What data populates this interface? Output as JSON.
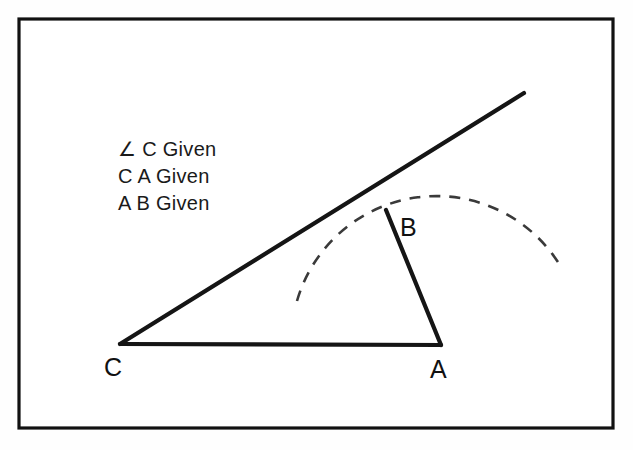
{
  "figure": {
    "background_color": "#fefefe",
    "frame": {
      "name": "outer-border",
      "stroke_color": "#111111",
      "x": 19,
      "y": 19,
      "width": 594,
      "height": 409
    },
    "given_list": {
      "lines": [
        "∠ C Given",
        "C A Given",
        "A B Given"
      ],
      "x": 118,
      "y_start": 156,
      "line_height": 27,
      "font_size": 20,
      "color": "#1a1a1a"
    },
    "points": {
      "C": {
        "label": "C",
        "x": 120,
        "y": 344,
        "label_x": 104,
        "label_y": 376
      },
      "A": {
        "label": "A",
        "x": 441,
        "y": 344,
        "label_x": 430,
        "label_y": 378
      },
      "B": {
        "label": "B",
        "x": 386,
        "y": 210,
        "label_x": 400,
        "label_y": 236
      },
      "ray_end": {
        "label": "",
        "x": 524,
        "y": 93
      }
    },
    "segments": [
      {
        "name": "ray-from-c",
        "from": "C",
        "to": "ray_end",
        "style": "solid",
        "stroke_width": 4.2,
        "color": "#151515"
      },
      {
        "name": "base-c-to-a",
        "from": "C",
        "to": "A",
        "style": "solid",
        "stroke_width": 4.2,
        "color": "#151515"
      },
      {
        "name": "side-a-to-b",
        "from": "A",
        "to": "B",
        "style": "solid",
        "stroke_width": 4.2,
        "color": "#151515"
      }
    ],
    "arc": {
      "name": "compass-arc-from-a",
      "center": "A",
      "radius": 145,
      "style": "dashed",
      "dash_pattern": "11 9",
      "color": "#3a3a3a",
      "stroke_width": 2.6,
      "start_x": 297,
      "start_y": 301,
      "end_x": 561,
      "end_y": 267,
      "sweep_description": "arc centered at A passing through B"
    }
  }
}
